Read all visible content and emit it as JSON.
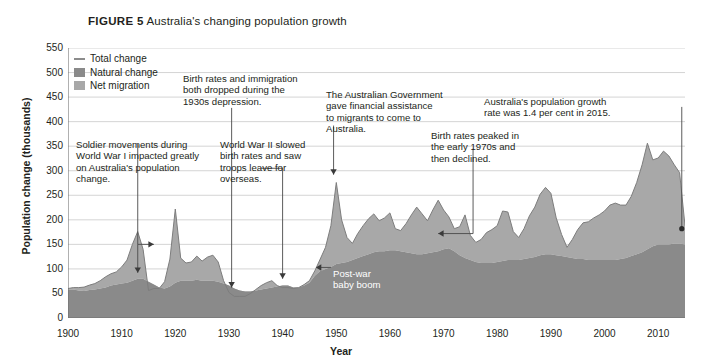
{
  "figure": {
    "number_label": "FIGURE 5",
    "caption": "Australia's changing population growth"
  },
  "axes": {
    "ylabel": "Population change (thousands)",
    "xlabel": "Year",
    "yticks": [
      "0",
      "50",
      "100",
      "150",
      "200",
      "250",
      "300",
      "350",
      "400",
      "450",
      "500",
      "550"
    ],
    "xticks": [
      "1900",
      "1910",
      "1920",
      "1930",
      "1940",
      "1950",
      "1960",
      "1970",
      "1980",
      "1990",
      "2000",
      "2010"
    ]
  },
  "legend": {
    "items": [
      {
        "label": "Total change",
        "type": "line",
        "color": "#8c8c8c"
      },
      {
        "label": "Natural change",
        "type": "area",
        "color": "#8a8a8a"
      },
      {
        "label": "Net migration",
        "type": "area",
        "color": "#a8a8a8"
      }
    ]
  },
  "annotations": [
    {
      "id": "ww1",
      "text": "Soldier movements during\nWorld War I impacted greatly\non Australia's population\nchange."
    },
    {
      "id": "depression",
      "text": "Birth rates and immigration\nboth dropped during the\n1930s depression."
    },
    {
      "id": "ww2",
      "text": "World War II slowed\nbirth rates and saw\ntroops leave for\noverseas."
    },
    {
      "id": "migration-assistance",
      "text": "The Australian Government\ngave financial assistance\nto migrants to come to\nAustralia."
    },
    {
      "id": "birth-peak-1970s",
      "text": "Birth rates peaked in\nthe early 1970s and\nthen declined."
    },
    {
      "id": "growth-rate-2015",
      "text": "Australia's population growth\nrate was 1.4 per cent in 2015."
    },
    {
      "id": "baby-boom",
      "text": "Post-war\nbaby boom"
    }
  ],
  "colors": {
    "natural_change": "#8a8a8a",
    "net_migration": "#a8a8a8",
    "total_change_line": "#8c8c8c",
    "grid": "#c9c9c9",
    "axis": "#6f6f6f",
    "text": "#231f20"
  },
  "chart_data": {
    "type": "area",
    "title": "Australia's changing population growth",
    "subtitle": "",
    "xlabel": "Year",
    "ylabel": "Population change (thousands)",
    "xlim": [
      1900,
      2015
    ],
    "ylim": [
      0,
      550
    ],
    "grid": true,
    "legend_position": "top-left",
    "stacked": true,
    "note": "Natural change is the lower (dark) band; net migration is stacked on top (light band). Total change is the outer line.",
    "x": [
      1900,
      1901,
      1902,
      1903,
      1904,
      1905,
      1906,
      1907,
      1908,
      1909,
      1910,
      1911,
      1912,
      1913,
      1914,
      1915,
      1916,
      1917,
      1918,
      1919,
      1920,
      1921,
      1922,
      1923,
      1924,
      1925,
      1926,
      1927,
      1928,
      1929,
      1930,
      1931,
      1932,
      1933,
      1934,
      1935,
      1936,
      1937,
      1938,
      1939,
      1940,
      1941,
      1942,
      1943,
      1944,
      1945,
      1946,
      1947,
      1948,
      1949,
      1950,
      1951,
      1952,
      1953,
      1954,
      1955,
      1956,
      1957,
      1958,
      1959,
      1960,
      1961,
      1962,
      1963,
      1964,
      1965,
      1966,
      1967,
      1968,
      1969,
      1970,
      1971,
      1972,
      1973,
      1974,
      1975,
      1976,
      1977,
      1978,
      1979,
      1980,
      1981,
      1982,
      1983,
      1984,
      1985,
      1986,
      1987,
      1988,
      1989,
      1990,
      1991,
      1992,
      1993,
      1994,
      1995,
      1996,
      1997,
      1998,
      1999,
      2000,
      2001,
      2002,
      2003,
      2004,
      2005,
      2006,
      2007,
      2008,
      2009,
      2010,
      2011,
      2012,
      2013,
      2014,
      2015
    ],
    "series": [
      {
        "name": "Natural change",
        "color": "#8a8a8a",
        "values": [
          58,
          58,
          56,
          55,
          57,
          58,
          60,
          62,
          66,
          68,
          70,
          72,
          76,
          80,
          80,
          74,
          68,
          62,
          60,
          64,
          72,
          76,
          76,
          76,
          78,
          76,
          76,
          76,
          74,
          70,
          66,
          60,
          56,
          54,
          54,
          56,
          58,
          60,
          62,
          64,
          66,
          66,
          62,
          62,
          66,
          72,
          86,
          96,
          100,
          104,
          110,
          112,
          114,
          118,
          122,
          126,
          130,
          134,
          136,
          136,
          138,
          138,
          136,
          134,
          132,
          130,
          130,
          132,
          134,
          136,
          140,
          142,
          136,
          128,
          122,
          118,
          114,
          112,
          112,
          112,
          114,
          116,
          118,
          118,
          118,
          120,
          122,
          124,
          128,
          130,
          130,
          128,
          126,
          124,
          122,
          120,
          120,
          118,
          118,
          118,
          118,
          118,
          118,
          120,
          122,
          126,
          130,
          134,
          140,
          146,
          150,
          150,
          150,
          152,
          152,
          150
        ]
      },
      {
        "name": "Net migration",
        "color": "#a8a8a8",
        "values": [
          2,
          4,
          6,
          8,
          10,
          12,
          16,
          22,
          24,
          26,
          34,
          46,
          74,
          96,
          60,
          -18,
          -8,
          -2,
          14,
          56,
          150,
          46,
          36,
          38,
          48,
          40,
          48,
          52,
          40,
          6,
          -14,
          -16,
          -12,
          -10,
          -4,
          2,
          8,
          12,
          14,
          2,
          -4,
          -4,
          -2,
          0,
          2,
          4,
          10,
          24,
          44,
          84,
          166,
          88,
          50,
          34,
          50,
          62,
          72,
          78,
          62,
          68,
          76,
          44,
          42,
          58,
          78,
          96,
          82,
          66,
          86,
          104,
          80,
          64,
          46,
          58,
          88,
          50,
          40,
          48,
          62,
          68,
          74,
          102,
          98,
          58,
          46,
          62,
          86,
          102,
          124,
          136,
          124,
          76,
          44,
          20,
          38,
          60,
          74,
          78,
          86,
          92,
          100,
          112,
          116,
          108,
          104,
          118,
          146,
          178,
          216,
          172,
          176,
          190,
          180,
          160,
          144,
          38
        ]
      }
    ],
    "total_change": [
      60,
      62,
      62,
      63,
      67,
      70,
      76,
      84,
      90,
      94,
      104,
      118,
      150,
      176,
      140,
      56,
      60,
      60,
      74,
      120,
      222,
      122,
      112,
      114,
      126,
      116,
      124,
      128,
      114,
      76,
      52,
      44,
      44,
      44,
      50,
      58,
      66,
      72,
      76,
      66,
      62,
      62,
      60,
      62,
      68,
      76,
      96,
      120,
      144,
      188,
      276,
      200,
      164,
      152,
      172,
      188,
      202,
      212,
      198,
      204,
      214,
      182,
      178,
      192,
      210,
      226,
      212,
      198,
      220,
      240,
      220,
      206,
      182,
      186,
      210,
      168,
      154,
      160,
      174,
      180,
      188,
      218,
      216,
      176,
      164,
      182,
      208,
      226,
      252,
      266,
      254,
      204,
      170,
      144,
      160,
      180,
      194,
      196,
      204,
      210,
      218,
      230,
      234,
      230,
      230,
      248,
      276,
      312,
      356,
      322,
      326,
      340,
      330,
      312,
      296,
      188
    ],
    "annotations": [
      {
        "text": "Soldier movements during World War I impacted greatly on Australia's population change.",
        "points_to_year": [
          1915,
          1919
        ]
      },
      {
        "text": "Birth rates and immigration both dropped during the 1930s depression.",
        "points_to_year": [
          1930
        ]
      },
      {
        "text": "World War II slowed birth rates and saw troops leave for overseas.",
        "points_to_year": [
          1940
        ]
      },
      {
        "text": "The Australian Government gave financial assistance to migrants to come to Australia.",
        "points_to_year": [
          1950
        ]
      },
      {
        "text": "Birth rates peaked in the early 1970s and then declined.",
        "points_to_year": [
          1971
        ]
      },
      {
        "text": "Australia's population growth rate was 1.4 per cent in 2015.",
        "points_to_year": [
          2015
        ]
      },
      {
        "text": "Post-war baby boom",
        "points_to_year": [
          1947
        ]
      }
    ]
  }
}
